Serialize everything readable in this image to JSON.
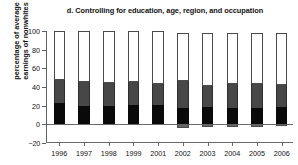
{
  "chart_data": {
    "type": "bar",
    "stacked": true,
    "title": "d. Controlling for education, age, region, and occupation",
    "xlabel": "",
    "ylabel": "percentage of average earnings of nonwhites",
    "ylim": [
      -20,
      100
    ],
    "yticks": [
      100,
      80,
      60,
      40,
      20,
      0,
      -20
    ],
    "ytick_labels": [
      "100",
      "80",
      "60",
      "40",
      "20",
      "0",
      "−20"
    ],
    "grid": false,
    "legend": "none",
    "categories": [
      "1996",
      "1997",
      "1998",
      "1999",
      "2001",
      "2002",
      "2003",
      "2004",
      "2005",
      "2006"
    ],
    "series": [
      {
        "name": "lower segment",
        "color": "#0a0a0a",
        "values": [
          23,
          20,
          19.5,
          20.5,
          21,
          18,
          19,
          18,
          17.5,
          19
        ]
      },
      {
        "name": "middle segment",
        "color": "#474747",
        "values": [
          24.5,
          25,
          25,
          25,
          22.5,
          28.5,
          22,
          25.5,
          25.5,
          23
        ]
      },
      {
        "name": "upper segment",
        "color": "#ffffff",
        "values": [
          52.5,
          55,
          55.5,
          54.5,
          56.5,
          51.5,
          57,
          54.5,
          55,
          56
        ]
      },
      {
        "name": "negative segment",
        "color": "#636363",
        "values": [
          0,
          0,
          0,
          0,
          0,
          -3.5,
          -2.5,
          -3,
          -3,
          -2
        ]
      }
    ],
    "bar_totals": [
      100,
      100,
      100,
      100,
      100,
      98,
      98,
      98,
      98,
      98
    ]
  }
}
